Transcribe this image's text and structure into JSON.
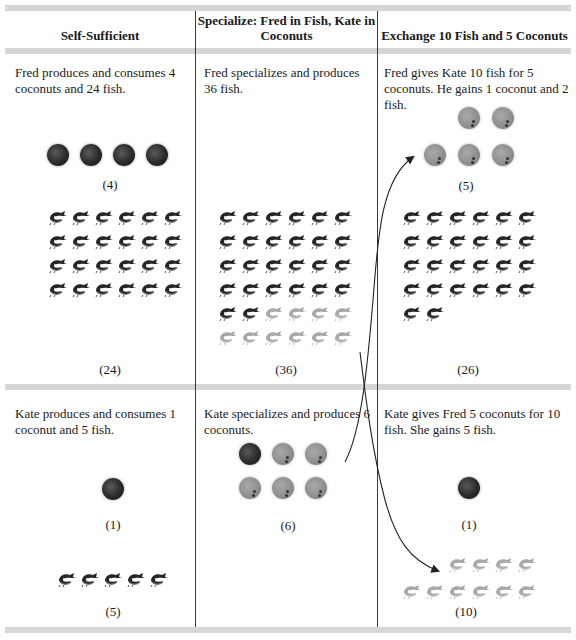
{
  "headers": {
    "col1": "Self-Sufficient",
    "col2": "Specialize: Fred in Fish, Kate in Coconuts",
    "col3": "Exchange 10 Fish and 5 Coconuts"
  },
  "fred": {
    "self_sufficient": {
      "description": "Fred produces and consumes 4 coconuts and 24 fish.",
      "coconuts": 4,
      "coconuts_label": "(4)",
      "fish": 24,
      "fish_label": "(24)"
    },
    "specialize": {
      "description": "Fred specializes and produces 36 fish.",
      "fish": 36,
      "fish_kept": 26,
      "fish_traded": 10,
      "fish_label": "(36)"
    },
    "exchange": {
      "description": "Fred gives Kate 10 fish for 5 coconuts. He gains 1 coconut and 2 fish.",
      "coconuts": 5,
      "coconuts_label": "(5)",
      "fish": 26,
      "fish_label": "(26)"
    }
  },
  "kate": {
    "self_sufficient": {
      "description": "Kate produces and consumes 1 coconut and 5 fish.",
      "coconuts": 1,
      "coconuts_label": "(1)",
      "fish": 5,
      "fish_label": "(5)"
    },
    "specialize": {
      "description": "Kate specializes and produces 6 coconuts.",
      "coconuts": 6,
      "coconuts_kept": 1,
      "coconuts_traded": 5,
      "coconuts_label": "(6)"
    },
    "exchange": {
      "description": "Kate gives Fred 5 coconuts for 10 fish. She gains 5 fish.",
      "coconuts": 1,
      "coconuts_label": "(1)",
      "fish": 10,
      "fish_label": "(10)"
    }
  },
  "colors": {
    "bar": "#d6d6d6",
    "divider": "#3a3a3a",
    "dark_item": "#222222",
    "traded_item": "#8d8d8d"
  },
  "icons": {
    "coconut": "coconut-icon",
    "fish": "fish-icon",
    "arrow": "curved-arrow-icon"
  }
}
